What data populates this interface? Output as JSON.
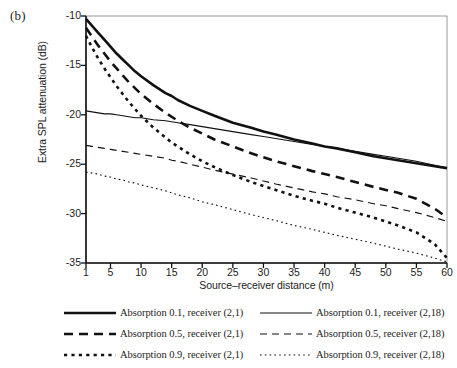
{
  "panel": {
    "label": "(b)"
  },
  "chart_data": {
    "type": "line",
    "title": "",
    "xlabel": "Source–receiver distance (m)",
    "ylabel": "Extra SPL attenuation (dB)",
    "xlim": [
      1,
      60
    ],
    "ylim": [
      -35,
      -10
    ],
    "xticks": [
      1,
      5,
      10,
      15,
      20,
      25,
      30,
      35,
      40,
      45,
      50,
      55,
      60
    ],
    "xtick_labels": [
      "1",
      "5",
      "10",
      "15",
      "20",
      "25",
      "30",
      "35",
      "40",
      "45",
      "50",
      "55",
      "60"
    ],
    "yticks": [
      -10,
      -15,
      -20,
      -25,
      -30,
      -35
    ],
    "ytick_labels": [
      "-10",
      "-15",
      "-20",
      "-25",
      "-30",
      "-35"
    ],
    "grid": false,
    "legend_position": "below",
    "line_color": "#111111",
    "x": [
      1,
      2,
      3,
      4,
      5,
      6,
      7,
      8,
      9,
      10,
      12,
      14,
      15,
      16,
      18,
      20,
      22,
      25,
      28,
      30,
      32,
      35,
      38,
      40,
      42,
      45,
      48,
      50,
      52,
      55,
      58,
      60
    ],
    "series": [
      {
        "name": "Absorption 0.1, receiver (2,1)",
        "absorption": 0.1,
        "receiver": "(2,1)",
        "style": "solid",
        "width": "thick",
        "values": [
          -10.3,
          -11.0,
          -11.7,
          -12.4,
          -13.1,
          -13.8,
          -14.4,
          -15.0,
          -15.6,
          -16.1,
          -17.0,
          -17.8,
          -18.1,
          -18.5,
          -19.1,
          -19.6,
          -20.1,
          -20.8,
          -21.3,
          -21.7,
          -22.0,
          -22.5,
          -22.9,
          -23.2,
          -23.4,
          -23.8,
          -24.2,
          -24.4,
          -24.6,
          -24.9,
          -25.2,
          -25.4
        ]
      },
      {
        "name": "Absorption 0.1, receiver (2,18)",
        "absorption": 0.1,
        "receiver": "(2,18)",
        "style": "solid",
        "width": "thin",
        "values": [
          -19.6,
          -19.7,
          -19.8,
          -19.9,
          -19.9,
          -20.0,
          -20.1,
          -20.2,
          -20.3,
          -20.3,
          -20.5,
          -20.6,
          -20.7,
          -20.8,
          -21.0,
          -21.2,
          -21.4,
          -21.7,
          -22.0,
          -22.2,
          -22.4,
          -22.7,
          -23.0,
          -23.2,
          -23.4,
          -23.7,
          -24.0,
          -24.2,
          -24.4,
          -24.7,
          -25.1,
          -25.4
        ]
      },
      {
        "name": "Absorption 0.5, receiver (2,1)",
        "absorption": 0.5,
        "receiver": "(2,1)",
        "style": "dashed",
        "width": "thick",
        "values": [
          -11.2,
          -12.1,
          -13.0,
          -13.8,
          -14.6,
          -15.3,
          -16.0,
          -16.7,
          -17.3,
          -17.9,
          -18.9,
          -19.8,
          -20.2,
          -20.6,
          -21.3,
          -21.9,
          -22.5,
          -23.2,
          -23.9,
          -24.3,
          -24.7,
          -25.2,
          -25.7,
          -26.0,
          -26.3,
          -26.8,
          -27.3,
          -27.6,
          -27.9,
          -28.5,
          -29.5,
          -30.4
        ]
      },
      {
        "name": "Absorption 0.5, receiver (2,18)",
        "absorption": 0.5,
        "receiver": "(2,18)",
        "style": "dashed",
        "width": "thin",
        "values": [
          -23.1,
          -23.2,
          -23.3,
          -23.4,
          -23.5,
          -23.6,
          -23.7,
          -23.8,
          -23.9,
          -24.0,
          -24.2,
          -24.4,
          -24.6,
          -24.7,
          -25.0,
          -25.3,
          -25.6,
          -26.0,
          -26.4,
          -26.7,
          -27.0,
          -27.4,
          -27.8,
          -28.0,
          -28.3,
          -28.6,
          -29.0,
          -29.2,
          -29.5,
          -29.9,
          -30.4,
          -30.8
        ]
      },
      {
        "name": "Absorption 0.9, receiver (2,1)",
        "absorption": 0.9,
        "receiver": "(2,1)",
        "style": "dotted",
        "width": "thick",
        "values": [
          -12.0,
          -13.2,
          -14.3,
          -15.3,
          -16.2,
          -17.1,
          -17.9,
          -18.7,
          -19.4,
          -20.1,
          -21.3,
          -22.3,
          -22.8,
          -23.2,
          -24.0,
          -24.7,
          -25.3,
          -26.1,
          -26.8,
          -27.2,
          -27.6,
          -28.2,
          -28.7,
          -29.0,
          -29.4,
          -29.9,
          -30.4,
          -30.8,
          -31.2,
          -31.9,
          -33.1,
          -34.5
        ]
      },
      {
        "name": "Absorption 0.9, receiver (2,18)",
        "absorption": 0.9,
        "receiver": "(2,18)",
        "style": "dotted",
        "width": "thin",
        "values": [
          -25.8,
          -25.9,
          -26.0,
          -26.2,
          -26.3,
          -26.5,
          -26.6,
          -26.8,
          -26.9,
          -27.1,
          -27.4,
          -27.7,
          -27.9,
          -28.1,
          -28.4,
          -28.8,
          -29.1,
          -29.6,
          -30.1,
          -30.4,
          -30.7,
          -31.2,
          -31.6,
          -31.9,
          -32.2,
          -32.6,
          -33.0,
          -33.3,
          -33.6,
          -34.0,
          -34.5,
          -34.9
        ]
      }
    ],
    "legend": [
      {
        "label": "Absorption 0.1, receiver (2,1)",
        "style": "solid",
        "width": "thick"
      },
      {
        "label": "Absorption 0.1, receiver (2,18)",
        "style": "solid",
        "width": "thin"
      },
      {
        "label": "Absorption 0.5, receiver (2,1)",
        "style": "dashed",
        "width": "thick"
      },
      {
        "label": "Absorption 0.5, receiver (2,18)",
        "style": "dashed",
        "width": "thin"
      },
      {
        "label": "Absorption 0.9, receiver (2,1)",
        "style": "dotted",
        "width": "thick"
      },
      {
        "label": "Absorption 0.9, receiver (2,18)",
        "style": "dotted",
        "width": "thin"
      }
    ]
  }
}
